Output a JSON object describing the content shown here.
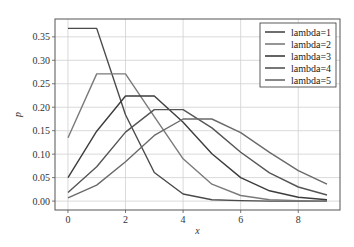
{
  "chart_data": {
    "type": "line",
    "title": "",
    "xlabel": "x",
    "ylabel": "p",
    "x": [
      0,
      1,
      2,
      3,
      4,
      5,
      6,
      7,
      8,
      9
    ],
    "xlim": [
      -0.45,
      9.45
    ],
    "ylim": [
      -0.019,
      0.388
    ],
    "xticks": [
      0,
      2,
      4,
      6,
      8
    ],
    "xtick_labels": [
      "0",
      "2",
      "4",
      "6",
      "8"
    ],
    "yticks": [
      0.0,
      0.05,
      0.1,
      0.15,
      0.2,
      0.25,
      0.3,
      0.35
    ],
    "ytick_labels": [
      "0.00",
      "0.05",
      "0.10",
      "0.15",
      "0.20",
      "0.25",
      "0.30",
      "0.35"
    ],
    "grid": true,
    "legend_position": "upper right",
    "series": [
      {
        "name": "lambda=1",
        "color": "#4a4a4a",
        "values": [
          0.368,
          0.368,
          0.184,
          0.061,
          0.015,
          0.003,
          0.001,
          0.0,
          0.0,
          0.0
        ]
      },
      {
        "name": "lambda=2",
        "color": "#7a7a7a",
        "values": [
          0.135,
          0.271,
          0.271,
          0.18,
          0.09,
          0.036,
          0.012,
          0.003,
          0.001,
          0.0
        ]
      },
      {
        "name": "lambda=3",
        "color": "#3c3c3c",
        "values": [
          0.05,
          0.149,
          0.224,
          0.224,
          0.168,
          0.101,
          0.05,
          0.022,
          0.008,
          0.003
        ]
      },
      {
        "name": "lambda=4",
        "color": "#555555",
        "values": [
          0.018,
          0.073,
          0.147,
          0.195,
          0.195,
          0.156,
          0.104,
          0.06,
          0.03,
          0.013
        ]
      },
      {
        "name": "lambda=5",
        "color": "#6a6a6a",
        "values": [
          0.007,
          0.034,
          0.084,
          0.14,
          0.175,
          0.175,
          0.146,
          0.104,
          0.065,
          0.036
        ]
      }
    ]
  },
  "legend": {
    "items": [
      "lambda=1",
      "lambda=2",
      "lambda=3",
      "lambda=4",
      "lambda=5"
    ]
  },
  "axes": {
    "xlabel": "x",
    "ylabel": "p"
  }
}
